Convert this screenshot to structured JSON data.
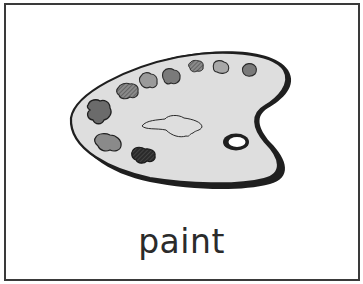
{
  "card": {
    "word": "paint",
    "illustration": "artist-palette"
  },
  "colors": {
    "border": "#3a3a3a",
    "palette_fill": "#dedede",
    "palette_outline": "#1f1f1f",
    "text": "#2b2b2b"
  }
}
